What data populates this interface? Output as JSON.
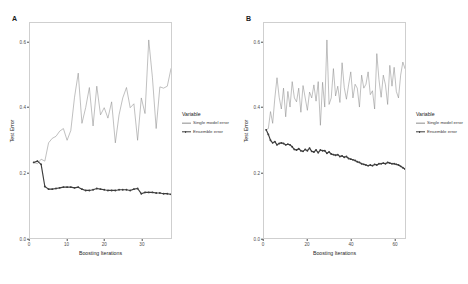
{
  "figure": {
    "background": "#ffffff",
    "panels": [
      {
        "tag": "A",
        "xlabel": "Boosting Iterations",
        "ylabel": "Test Error",
        "legend_title": "Variable"
      },
      {
        "tag": "B",
        "xlabel": "Boosting Iterations",
        "ylabel": "Test Error",
        "legend_title": "Variable"
      }
    ],
    "legend_entries": [
      {
        "label": "Single model error",
        "color": "#8c8c8c",
        "style": "thin-line"
      },
      {
        "label": "Ensemble error",
        "color": "#3d3d3d",
        "style": "thick-line-with-points"
      }
    ]
  },
  "chart_data": [
    {
      "type": "line",
      "title": "A",
      "xlabel": "Boosting Iterations",
      "ylabel": "Test Error",
      "xlim": [
        0,
        38
      ],
      "ylim": [
        0.0,
        0.66
      ],
      "xticks": [
        0,
        10,
        20,
        30
      ],
      "xticklabels": [
        "0",
        "10",
        "20",
        "30"
      ],
      "yticks": [
        0.0,
        0.2,
        0.4,
        0.6
      ],
      "yticklabels": [
        "0.0",
        "0.2",
        "0.4",
        "0.6"
      ],
      "grid": false,
      "legend_position": "right",
      "legend_title": "Variable",
      "x": [
        1,
        2,
        3,
        4,
        5,
        6,
        7,
        8,
        9,
        10,
        11,
        12,
        13,
        14,
        15,
        16,
        17,
        18,
        19,
        20,
        21,
        22,
        23,
        24,
        25,
        26,
        27,
        28,
        29,
        30,
        31,
        32,
        33,
        34,
        35,
        36,
        37,
        38
      ],
      "series": [
        {
          "name": "Single model error",
          "color": "#8c8c8c",
          "values": [
            0.232,
            0.228,
            0.242,
            0.236,
            0.292,
            0.306,
            0.312,
            0.328,
            0.336,
            0.3,
            0.33,
            0.432,
            0.506,
            0.352,
            0.4,
            0.462,
            0.344,
            0.466,
            0.378,
            0.4,
            0.368,
            0.418,
            0.292,
            0.378,
            0.43,
            0.462,
            0.4,
            0.412,
            0.3,
            0.43,
            0.382,
            0.608,
            0.492,
            0.336,
            0.464,
            0.46,
            0.466,
            0.52
          ]
        },
        {
          "name": "Ensemble error",
          "color": "#3d3d3d",
          "values": [
            0.232,
            0.236,
            0.226,
            0.158,
            0.15,
            0.15,
            0.152,
            0.154,
            0.156,
            0.156,
            0.156,
            0.154,
            0.156,
            0.15,
            0.146,
            0.146,
            0.148,
            0.152,
            0.15,
            0.148,
            0.146,
            0.146,
            0.146,
            0.148,
            0.148,
            0.148,
            0.146,
            0.15,
            0.152,
            0.136,
            0.14,
            0.14,
            0.14,
            0.138,
            0.138,
            0.136,
            0.136,
            0.134
          ]
        }
      ]
    },
    {
      "type": "line",
      "title": "B",
      "xlabel": "Boosting Iterations",
      "ylabel": "Test Error",
      "xlim": [
        0,
        65
      ],
      "ylim": [
        0.0,
        0.66
      ],
      "xticks": [
        0,
        20,
        40,
        60
      ],
      "xticklabels": [
        "0",
        "20",
        "40",
        "60"
      ],
      "yticks": [
        0.0,
        0.2,
        0.4,
        0.6
      ],
      "yticklabels": [
        "0.0",
        "0.2",
        "0.4",
        "0.6"
      ],
      "grid": false,
      "legend_position": "right",
      "legend_title": "Variable",
      "x": [
        1,
        2,
        3,
        4,
        5,
        6,
        7,
        8,
        9,
        10,
        11,
        12,
        13,
        14,
        15,
        16,
        17,
        18,
        19,
        20,
        21,
        22,
        23,
        24,
        25,
        26,
        27,
        28,
        29,
        30,
        31,
        32,
        33,
        34,
        35,
        36,
        37,
        38,
        39,
        40,
        41,
        42,
        43,
        44,
        45,
        46,
        47,
        48,
        49,
        50,
        51,
        52,
        53,
        54,
        55,
        56,
        57,
        58,
        59,
        60,
        61,
        62,
        63,
        64,
        65
      ],
      "series": [
        {
          "name": "Single model error",
          "color": "#8c8c8c",
          "values": [
            0.332,
            0.336,
            0.388,
            0.352,
            0.43,
            0.492,
            0.432,
            0.396,
            0.46,
            0.372,
            0.45,
            0.402,
            0.48,
            0.43,
            0.418,
            0.46,
            0.386,
            0.468,
            0.43,
            0.392,
            0.448,
            0.43,
            0.47,
            0.42,
            0.48,
            0.346,
            0.478,
            0.402,
            0.608,
            0.41,
            0.43,
            0.52,
            0.436,
            0.466,
            0.416,
            0.538,
            0.462,
            0.426,
            0.47,
            0.51,
            0.43,
            0.472,
            0.46,
            0.402,
            0.5,
            0.46,
            0.472,
            0.51,
            0.44,
            0.452,
            0.396,
            0.566,
            0.486,
            0.432,
            0.5,
            0.47,
            0.41,
            0.53,
            0.466,
            0.524,
            0.45,
            0.43,
            0.5,
            0.54,
            0.52
          ]
        },
        {
          "name": "Ensemble error",
          "color": "#3d3d3d",
          "values": [
            0.332,
            0.318,
            0.3,
            0.292,
            0.296,
            0.286,
            0.29,
            0.292,
            0.29,
            0.286,
            0.288,
            0.286,
            0.28,
            0.272,
            0.27,
            0.274,
            0.268,
            0.266,
            0.272,
            0.268,
            0.276,
            0.266,
            0.264,
            0.27,
            0.262,
            0.27,
            0.268,
            0.268,
            0.26,
            0.264,
            0.258,
            0.256,
            0.254,
            0.256,
            0.25,
            0.252,
            0.248,
            0.25,
            0.244,
            0.242,
            0.24,
            0.238,
            0.234,
            0.232,
            0.228,
            0.226,
            0.224,
            0.222,
            0.224,
            0.222,
            0.226,
            0.224,
            0.228,
            0.228,
            0.23,
            0.228,
            0.232,
            0.23,
            0.228,
            0.228,
            0.226,
            0.224,
            0.22,
            0.216,
            0.212
          ]
        }
      ]
    }
  ]
}
